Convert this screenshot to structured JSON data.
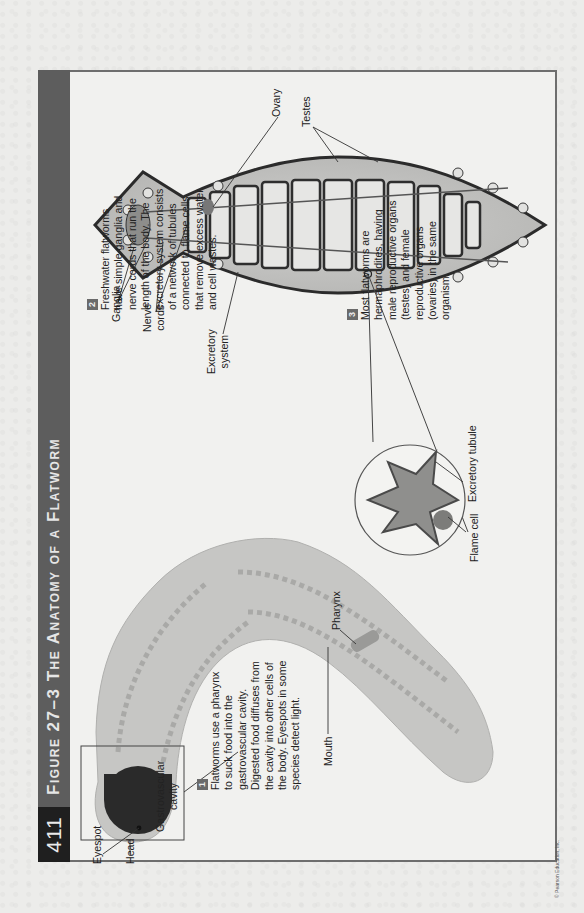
{
  "page": {
    "orientation": "rotated 90 degrees counter-clockwise",
    "page_number": "411",
    "figure_title": "Figure 27–3 The Anatomy of a Flatworm",
    "copyright": "© Pearson Education, Inc."
  },
  "captions": [
    {
      "number": "1",
      "text_lines": [
        "Flatworms use a pharynx",
        "to suck food into the",
        "gastrovascular cavity.",
        "Digested food diffuses from",
        "the cavity into other cells of",
        "the body. Eyespots in some",
        "species detect light."
      ]
    },
    {
      "number": "2",
      "text_lines": [
        "Freshwater flatworms",
        "have simple ganglia and",
        "nerve cords that run the",
        "length of the body. The",
        "excretory system consists",
        "of a network of tubules",
        "connected to flame cells",
        "that remove excess water",
        "and cell wastes."
      ]
    },
    {
      "number": "3",
      "text_lines": [
        "Most flatworms are",
        "hermaphrodites, having",
        "male reproductive organs",
        "(testes) and female",
        "reproductive organs",
        "(ovaries) in the same",
        "organism."
      ]
    }
  ],
  "labels": {
    "eyespot": "Eyespot",
    "head": "Head",
    "gastrovascular_cavity": [
      "Gastrovascular",
      "cavity"
    ],
    "pharynx": "Pharynx",
    "mouth": "Mouth",
    "ganglia": "Ganglia",
    "nerve_cords": [
      "Nerve",
      "cords"
    ],
    "excretory_system": [
      "Excretory",
      "system"
    ],
    "ovary": "Ovary",
    "testes": "Testes",
    "flame_cell": "Flame cell",
    "excretory_tubule": "Excretory tubule"
  },
  "colors": {
    "title_band": "#5d5d5d",
    "page_number_block": "#1f1f1f",
    "frame_border": "#6e6e6e",
    "paper": "#f1f1ef"
  }
}
